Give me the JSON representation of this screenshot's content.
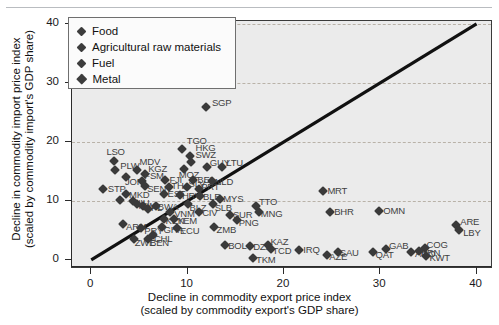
{
  "chart_data": {
    "type": "scatter",
    "title": "",
    "xlabel": "Decline in commodity export price index (scaled by commodity export's GDP share)",
    "xlabel_line1": "Decline in commodity export price index",
    "xlabel_line2": "(scaled by commodity export's GDP share)",
    "ylabel_line1": "Decline in commodity import price index",
    "ylabel_line2": "(scaled by commodity import's GDP share)",
    "xlim": [
      -2.0,
      41.5
    ],
    "ylim": [
      -1.2,
      40.5
    ],
    "xticks": [
      0,
      10,
      20,
      30,
      40
    ],
    "yticks": [
      0,
      10,
      20,
      30,
      40
    ],
    "xtick_labels": [
      "0",
      "10",
      "20",
      "30",
      "40"
    ],
    "ytick_labels": [
      "0",
      "10",
      "20",
      "30",
      "40"
    ],
    "grid": "horizontal-dashed",
    "reference_line": {
      "type": "45-degree",
      "from": [
        0,
        0
      ],
      "to": [
        40,
        40
      ]
    },
    "legend": {
      "position": "top-left",
      "entries": [
        {
          "label": "Food",
          "marker": "diamond",
          "color": "#3d3d3d"
        },
        {
          "label": "Agricultural raw materials",
          "marker": "diamond",
          "color": "#3d3d3d"
        },
        {
          "label": "Fuel",
          "marker": "diamond",
          "color": "#3d3d3d"
        },
        {
          "label": "Metal",
          "marker": "diamond",
          "color": "#3d3d3d"
        }
      ]
    },
    "marker_color": "#3a3a3a",
    "label_color": "#3f3f3f",
    "plot_bg": "#ebebeb",
    "points": [
      {
        "code": "SGP",
        "x": 11.9,
        "y": 26.0,
        "dx": 6,
        "dy": -4
      },
      {
        "code": "TGO",
        "x": 9.4,
        "y": 18.8,
        "dx": 5,
        "dy": -8
      },
      {
        "code": "HKG",
        "x": 10.3,
        "y": 17.6,
        "dx": 5,
        "dy": -8
      },
      {
        "code": "SWZ",
        "x": 10.4,
        "y": 16.6,
        "dx": 4,
        "dy": -7
      },
      {
        "code": "LSO",
        "x": 2.4,
        "y": 16.7,
        "dx": -8,
        "dy": -9
      },
      {
        "code": "PLW",
        "x": 2.5,
        "y": 15.2,
        "dx": 5,
        "dy": -4
      },
      {
        "code": "MDV",
        "x": 4.7,
        "y": 15.3,
        "dx": 3,
        "dy": -8
      },
      {
        "code": "MOZ",
        "x": 9.6,
        "y": 15.4,
        "dx": -5,
        "dy": 6
      },
      {
        "code": "GUY",
        "x": 12.0,
        "y": 15.8,
        "dx": 3,
        "dy": -4
      },
      {
        "code": "LTU",
        "x": 13.6,
        "y": 15.7,
        "dx": 4,
        "dy": -4
      },
      {
        "code": "JOR",
        "x": 3.6,
        "y": 14.0,
        "dx": -1,
        "dy": 5
      },
      {
        "code": "KGZ",
        "x": 5.6,
        "y": 14.6,
        "dx": 3,
        "dy": -5
      },
      {
        "code": "FJI",
        "x": 7.7,
        "y": 13.6,
        "dx": 4,
        "dy": 0
      },
      {
        "code": "BEL",
        "x": 10.6,
        "y": 13.5,
        "dx": 4,
        "dy": 0
      },
      {
        "code": "NLD",
        "x": 12.5,
        "y": 13.4,
        "dx": 3,
        "dy": 1
      },
      {
        "code": "FSM",
        "x": 5.3,
        "y": 13.4,
        "dx": 2,
        "dy": -5
      },
      {
        "code": "SEN",
        "x": 5.6,
        "y": 12.5,
        "dx": 2,
        "dy": 3
      },
      {
        "code": "THA",
        "x": 8.1,
        "y": 12.4,
        "dx": 2,
        "dy": -1
      },
      {
        "code": "STP",
        "x": 1.2,
        "y": 12.0,
        "dx": 5,
        "dy": 0
      },
      {
        "code": "SLV",
        "x": 9.9,
        "y": 12.3,
        "dx": 2,
        "dy": -3
      },
      {
        "code": "PRT",
        "x": 11.2,
        "y": 12.1,
        "dx": 2,
        "dy": -2
      },
      {
        "code": "MKD",
        "x": 3.6,
        "y": 11.1,
        "dx": 3,
        "dy": 1
      },
      {
        "code": "EST",
        "x": 7.5,
        "y": 11.1,
        "dx": 4,
        "dy": 0
      },
      {
        "code": "HRV",
        "x": 9.2,
        "y": 11.0,
        "dx": 2,
        "dy": 1
      },
      {
        "code": "BLR",
        "x": 11.3,
        "y": 10.9,
        "dx": 3,
        "dy": 1
      },
      {
        "code": "MYS",
        "x": 13.4,
        "y": 10.4,
        "dx": 3,
        "dy": 0
      },
      {
        "code": "SLB",
        "x": 12.6,
        "y": 9.5,
        "dx": 2,
        "dy": 4
      },
      {
        "code": "MRT_c",
        "x": 3.0,
        "y": 10.1,
        "dx": 3,
        "dy": 2
      },
      {
        "code": "NIU",
        "x": 4.3,
        "y": 10.0,
        "dx": 1,
        "dy": 2
      },
      {
        "code": "MWI",
        "x": 4.8,
        "y": 9.4,
        "dx": 1,
        "dy": 2
      },
      {
        "code": "NPL",
        "x": 5.4,
        "y": 9.2,
        "dx": 1,
        "dy": 2
      },
      {
        "code": "BWA",
        "x": 6.7,
        "y": 9.1,
        "dx": 2,
        "dy": 1
      },
      {
        "code": "MNG_c",
        "x": 5.9,
        "y": 8.6,
        "dx": 0,
        "dy": 3
      },
      {
        "code": "VNM",
        "x": 8.2,
        "y": 8.2,
        "dx": 4,
        "dy": 2
      },
      {
        "code": "BLZ",
        "x": 10.0,
        "y": 9.5,
        "dx": 2,
        "dy": 4
      },
      {
        "code": "CIV",
        "x": 11.2,
        "y": 8.1,
        "dx": 3,
        "dy": 1
      },
      {
        "code": "SUR",
        "x": 14.4,
        "y": 7.6,
        "dx": 3,
        "dy": 0
      },
      {
        "code": "TTO",
        "x": 17.1,
        "y": 9.1,
        "dx": 3,
        "dy": -4
      },
      {
        "code": "MNG",
        "x": 17.4,
        "y": 8.2,
        "dx": 2,
        "dy": 2
      },
      {
        "code": "PNG",
        "x": 15.1,
        "y": 6.8,
        "dx": 2,
        "dy": 3
      },
      {
        "code": "ARM",
        "x": 3.3,
        "y": 6.1,
        "dx": 3,
        "dy": 3
      },
      {
        "code": "KEN",
        "x": 7.5,
        "y": 7.0,
        "dx": 2,
        "dy": 2
      },
      {
        "code": "YEM",
        "x": 8.6,
        "y": 6.9,
        "dx": 3,
        "dy": 2
      },
      {
        "code": "PRY",
        "x": 5.2,
        "y": 5.4,
        "dx": 3,
        "dy": 3
      },
      {
        "code": "GHA",
        "x": 7.3,
        "y": 5.5,
        "dx": 2,
        "dy": 3
      },
      {
        "code": "ECU",
        "x": 8.9,
        "y": 5.4,
        "dx": 3,
        "dy": 3
      },
      {
        "code": "ZMB",
        "x": 12.7,
        "y": 5.5,
        "dx": 3,
        "dy": 3
      },
      {
        "code": "CHL",
        "x": 6.4,
        "y": 4.2,
        "dx": 1,
        "dy": 4
      },
      {
        "code": "ZWE",
        "x": 4.4,
        "y": 3.6,
        "dx": 1,
        "dy": 4
      },
      {
        "code": "BEN",
        "x": 5.9,
        "y": 3.5,
        "dx": 2,
        "dy": 4
      },
      {
        "code": "BOL",
        "x": 13.9,
        "y": 2.5,
        "dx": 3,
        "dy": 1
      },
      {
        "code": "DZA",
        "x": 16.5,
        "y": 2.4,
        "dx": 3,
        "dy": 1
      },
      {
        "code": "KAZ",
        "x": 18.4,
        "y": 2.5,
        "dx": 2,
        "dy": -3
      },
      {
        "code": "TCD",
        "x": 18.7,
        "y": 1.8,
        "dx": 1,
        "dy": 2
      },
      {
        "code": "TKM",
        "x": 16.8,
        "y": 0.4,
        "dx": 3,
        "dy": 2
      },
      {
        "code": "MRT",
        "x": 24.1,
        "y": 11.6,
        "dx": 4,
        "dy": 0
      },
      {
        "code": "BHR",
        "x": 24.8,
        "y": 8.1,
        "dx": 4,
        "dy": 0
      },
      {
        "code": "OMN",
        "x": 29.9,
        "y": 8.3,
        "dx": 4,
        "dy": 0
      },
      {
        "code": "ARE",
        "x": 37.9,
        "y": 5.9,
        "dx": 4,
        "dy": -3
      },
      {
        "code": "LBY",
        "x": 38.2,
        "y": 5.1,
        "dx": 4,
        "dy": 3
      },
      {
        "code": "IRQ",
        "x": 21.6,
        "y": 1.7,
        "dx": 4,
        "dy": 0
      },
      {
        "code": "AZE",
        "x": 24.5,
        "y": 0.9,
        "dx": 2,
        "dy": 2
      },
      {
        "code": "SAU",
        "x": 25.6,
        "y": 1.3,
        "dx": 2,
        "dy": 1
      },
      {
        "code": "QAT",
        "x": 29.3,
        "y": 1.3,
        "dx": 2,
        "dy": 3
      },
      {
        "code": "GAB",
        "x": 30.6,
        "y": 1.9,
        "dx": 3,
        "dy": -3
      },
      {
        "code": "AGO",
        "x": 33.2,
        "y": 1.4,
        "dx": 0,
        "dy": 2
      },
      {
        "code": "BRN",
        "x": 34.0,
        "y": 1.5,
        "dx": 2,
        "dy": 2
      },
      {
        "code": "COG",
        "x": 34.6,
        "y": 2.1,
        "dx": 2,
        "dy": -3
      },
      {
        "code": "KWT",
        "x": 34.8,
        "y": 0.6,
        "dx": 3,
        "dy": 2
      }
    ]
  }
}
